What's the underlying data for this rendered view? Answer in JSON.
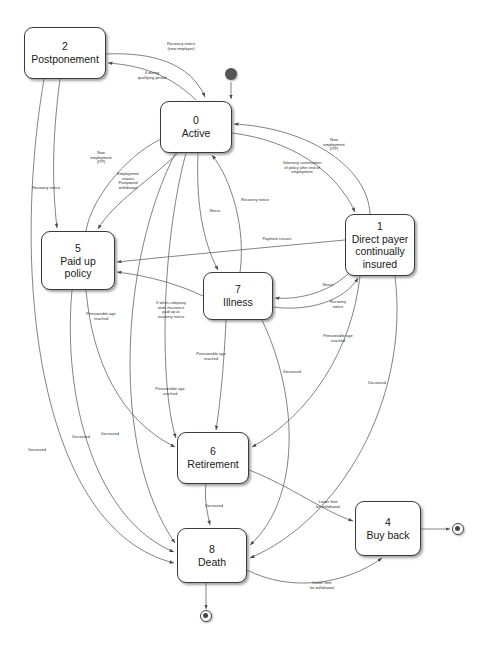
{
  "diagram": {
    "type": "uml-state-diagram",
    "stroke_color": "#3a3a3a",
    "edge_color": "#555555",
    "text_color": "#202020"
  },
  "states": [
    {
      "id": "2",
      "label": "Postponement",
      "x": 24,
      "y": 27,
      "w": 82,
      "h": 52
    },
    {
      "id": "0",
      "label": "Active",
      "x": 160,
      "y": 101,
      "w": 72,
      "h": 52
    },
    {
      "id": "1",
      "label": "Direct payer\ncontinually\ninsured",
      "x": 345,
      "y": 214,
      "w": 70,
      "h": 62
    },
    {
      "id": "5",
      "label": "Paid up\npolicy",
      "x": 41,
      "y": 231,
      "w": 74,
      "h": 59
    },
    {
      "id": "7",
      "label": "Illness",
      "x": 203,
      "y": 272,
      "w": 70,
      "h": 48
    },
    {
      "id": "6",
      "label": "Retirement",
      "x": 177,
      "y": 432,
      "w": 72,
      "h": 52
    },
    {
      "id": "8",
      "label": "Death",
      "x": 177,
      "y": 528,
      "w": 70,
      "h": 55
    },
    {
      "id": "4",
      "label": "Buy back",
      "x": 355,
      "y": 501,
      "w": 66,
      "h": 55
    }
  ],
  "pseudo_states": [
    {
      "kind": "initial-state",
      "x": 231,
      "y": 74
    },
    {
      "kind": "final-state",
      "x": 458,
      "y": 529
    },
    {
      "kind": "final-state",
      "x": 206,
      "y": 616
    }
  ],
  "edge_labels": [
    {
      "text": "Recovery notice\n(new employer)",
      "x": 181,
      "y": 47
    },
    {
      "text": "If during\nqualifying period",
      "x": 152,
      "y": 76
    },
    {
      "text": "New\nemployment\n(ITP)",
      "x": 101,
      "y": 158
    },
    {
      "text": "Employment\nceases\nPostponed\nwithdrawal",
      "x": 128,
      "y": 181
    },
    {
      "text": "Recovery notice",
      "x": 46,
      "y": 188
    },
    {
      "text": "New\nemployment\n(ITP)",
      "x": 334,
      "y": 145
    },
    {
      "text": "Voluntary continuation\nof policy after end of\nemployment",
      "x": 302,
      "y": 168
    },
    {
      "text": "Illness",
      "x": 215,
      "y": 211
    },
    {
      "text": "Recovery notice",
      "x": 255,
      "y": 200
    },
    {
      "text": "Payment ceases",
      "x": 277,
      "y": 239
    },
    {
      "text": "Illness",
      "x": 328,
      "y": 285
    },
    {
      "text": "Recovery\nnotice",
      "x": 338,
      "y": 305
    },
    {
      "text": "If when company\nends insurance\npaid up at\nrecovery notice",
      "x": 171,
      "y": 310
    },
    {
      "text": "Pensionable age\nreached",
      "x": 101,
      "y": 317
    },
    {
      "text": "Pensionable age\nreached",
      "x": 211,
      "y": 357
    },
    {
      "text": "Pensionable age\nreached",
      "x": 170,
      "y": 392
    },
    {
      "text": "Pensionable age\nreached",
      "x": 338,
      "y": 339
    },
    {
      "text": "Deceased",
      "x": 292,
      "y": 372
    },
    {
      "text": "Deceased",
      "x": 377,
      "y": 383
    },
    {
      "text": "Deceased",
      "x": 110,
      "y": 434
    },
    {
      "text": "Deceased",
      "x": 81,
      "y": 437
    },
    {
      "text": "Deceased",
      "x": 37,
      "y": 450
    },
    {
      "text": "Deceased",
      "x": 214,
      "y": 506
    },
    {
      "text": "Lower limit\nfor withdrawal",
      "x": 328,
      "y": 505
    },
    {
      "text": "Lower limit\nfor withdrawal",
      "x": 322,
      "y": 586
    }
  ]
}
